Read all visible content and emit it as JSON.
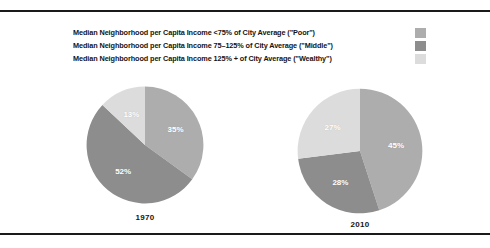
{
  "figure": {
    "background_color": "#ffffff",
    "rule_color": "#1a1a1a"
  },
  "legend": {
    "items": [
      {
        "label": "Median Neighborhood per Capita Income <75% of City Average (\"Poor\")",
        "category": "Poor",
        "color": "#adadad"
      },
      {
        "label": "Median Neighborhood per Capita Income 75–125% of City Average (\"Middle\")",
        "category": "Middle",
        "color": "#8d8d8d"
      },
      {
        "label": "Median Neighborhood per Capita Income 125% + of City Average (\"Wealthy\")",
        "category": "Wealthy",
        "color": "#dcdcdc"
      }
    ]
  },
  "chart_data": [
    {
      "type": "pie",
      "title": "1970",
      "labels": [
        "Poor",
        "Middle",
        "Wealthy"
      ],
      "values": [
        35,
        52,
        13
      ],
      "value_labels": [
        "35%",
        "52%",
        "13%"
      ],
      "colors": [
        "#adadad",
        "#8d8d8d",
        "#dcdcdc"
      ],
      "start_angle": 0,
      "direction": "clockwise",
      "legend_position": "top",
      "grid": false
    },
    {
      "type": "pie",
      "title": "2010",
      "labels": [
        "Poor",
        "Middle",
        "Wealthy"
      ],
      "values": [
        45,
        28,
        27
      ],
      "value_labels": [
        "45%",
        "28%",
        "27%"
      ],
      "colors": [
        "#adadad",
        "#8d8d8d",
        "#dcdcdc"
      ],
      "start_angle": 0,
      "direction": "clockwise",
      "legend_position": "top",
      "grid": false
    }
  ]
}
